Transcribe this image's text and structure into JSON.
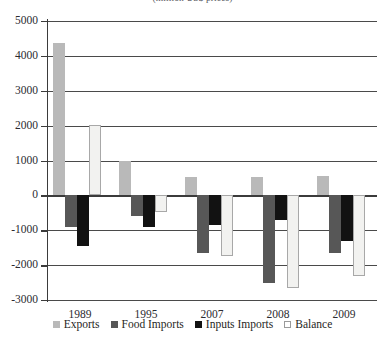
{
  "caption": "(million US$ prices)",
  "chart_data": {
    "type": "bar",
    "title": "",
    "subtitle": "(million US$ prices)",
    "xlabel": "",
    "ylabel": "",
    "ylim": [
      -3000,
      5000
    ],
    "ytick_step": 1000,
    "yticks": [
      5000,
      4000,
      3000,
      2000,
      1000,
      0,
      -1000,
      -2000,
      -3000
    ],
    "ytick_labels": [
      "5000",
      "4000",
      "3000",
      "2000",
      "1000",
      "0",
      "-1000",
      "-2000",
      "-3000"
    ],
    "grid": true,
    "legend_position": "bottom",
    "categories": [
      "1989",
      "1995",
      "2007",
      "2008",
      "2009"
    ],
    "series": [
      {
        "name": "Exports",
        "color": "#b9b9b9",
        "values": [
          4380,
          1000,
          520,
          520,
          550
        ]
      },
      {
        "name": "Food Imports",
        "color": "#575757",
        "values": [
          -900,
          -600,
          -1650,
          -2500,
          -1650
        ]
      },
      {
        "name": "Inputs Imports",
        "color": "#121212",
        "values": [
          -1450,
          -900,
          -850,
          -700,
          -1300
        ]
      },
      {
        "name": "Balance",
        "color": "#f2f2f0",
        "values": [
          2030,
          -480,
          -1750,
          -2650,
          -2300
        ]
      }
    ]
  },
  "legend": {
    "items": [
      {
        "label": "Exports",
        "swatch": "exports"
      },
      {
        "label": "Food Imports",
        "swatch": "food"
      },
      {
        "label": "Inputs Imports",
        "swatch": "inputs"
      },
      {
        "label": "Balance",
        "swatch": "balance"
      }
    ]
  }
}
